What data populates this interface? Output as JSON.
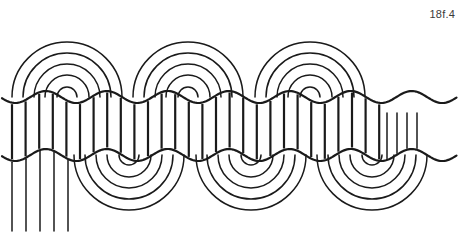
{
  "figure": {
    "caption": "18f.4",
    "canvas": {
      "width": 465,
      "height": 237,
      "background": "#ffffff"
    },
    "stroke": {
      "color": "#1a1a1a",
      "thin_width": 1.5,
      "thick_width": 2.2
    }
  },
  "pattern": {
    "band": {
      "top_wave_y": 97,
      "bottom_wave_y": 155,
      "wave_amplitude": 6,
      "wave_period": 61,
      "wave_phase": 0,
      "hatch_count": 28,
      "hatch_start_x": 12,
      "hatch_spacing": 13.6,
      "hatch_label": "vertical band hatching"
    },
    "top_arches": {
      "label": "upper concentric arch groups",
      "centers": [
        67,
        188,
        310
      ],
      "baseline_y": 97,
      "radii": [
        55,
        44,
        33,
        22,
        10
      ],
      "direction": "up"
    },
    "bottom_arches": {
      "label": "lower concentric arch groups",
      "centers": [
        129,
        251,
        372
      ],
      "baseline_y": 155,
      "radii": [
        55,
        44,
        33,
        22,
        10
      ],
      "direction": "down"
    },
    "left_fringe": {
      "label": "left hanging vertical lines",
      "x_positions": [
        12,
        26,
        40,
        54,
        68
      ],
      "y_start": 158,
      "y_end": 231
    },
    "right_fringe": {
      "label": "right short vertical lines",
      "x_positions": [
        387,
        397,
        407,
        417
      ],
      "y_start": 113,
      "y_end": 152
    }
  }
}
